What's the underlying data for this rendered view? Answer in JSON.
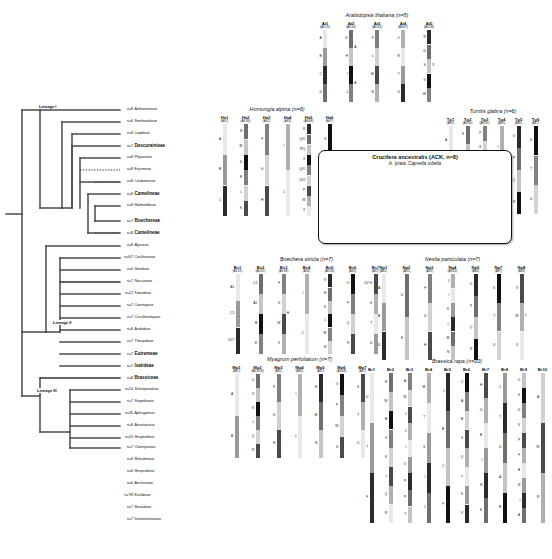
{
  "tree": {
    "lineages": [
      {
        "label": "Lineage I",
        "x": 38,
        "y": 34
      },
      {
        "label": "Lineage II",
        "x": 56,
        "y": 219
      },
      {
        "label": "Lineage III",
        "x": 38,
        "y": 268
      }
    ],
    "taxa": [
      {
        "n": "n=8",
        "name": "Aethionemeae",
        "bold": false
      },
      {
        "n": "n=6",
        "name": "Smelowskieae",
        "bold": false
      },
      {
        "n": "n=8",
        "name": "Lepidieae",
        "bold": false
      },
      {
        "n": "n=7",
        "name": "Descurainieae",
        "bold": true
      },
      {
        "n": "n=8",
        "name": "Physarieae",
        "bold": false
      },
      {
        "n": "n=8",
        "name": "Erysimeae",
        "bold": false
      },
      {
        "n": "n=8",
        "name": "Cardamineae",
        "bold": false
      },
      {
        "n": "n=8",
        "name": "Camelineae",
        "bold": true
      },
      {
        "n": "n=8",
        "name": "Halimolobeae",
        "bold": false
      },
      {
        "n": "n=7",
        "name": "Boechereae",
        "bold": true
      },
      {
        "n": "n=8",
        "name": "Camelineae",
        "bold": true
      },
      {
        "n": "n=8",
        "name": "Alysseae",
        "bold": false
      },
      {
        "n": "n=6/7",
        "name": "Cochlearieae",
        "bold": false
      },
      {
        "n": "n=6",
        "name": "Iberideae",
        "bold": false
      },
      {
        "n": "n=7",
        "name": "Noccaeeae",
        "bold": false
      },
      {
        "n": "n=12",
        "name": "Fanoideae",
        "bold": false
      },
      {
        "n": "n=7",
        "name": "Conringieae",
        "bold": false
      },
      {
        "n": "n=7",
        "name": "Crucihimalayeae",
        "bold": false
      },
      {
        "n": "n=8",
        "name": "Arabideae",
        "bold": false
      },
      {
        "n": "n=7",
        "name": "Thlaspideae",
        "bold": false
      },
      {
        "n": "n=7",
        "name": "Eutremeae",
        "bold": true
      },
      {
        "n": "n=7",
        "name": "Isatideae",
        "bold": true
      },
      {
        "n": "n=8",
        "name": "Brassiceae",
        "bold": true
      },
      {
        "n": "n=14",
        "name": "Schizopetaleae",
        "bold": false
      },
      {
        "n": "n=7",
        "name": "Sisymbrieae",
        "bold": false
      },
      {
        "n": "n=36",
        "name": "Aphragmeae",
        "bold": false
      },
      {
        "n": "n=8",
        "name": "Anastaticeae",
        "bold": false
      },
      {
        "n": "n=10",
        "name": "Hesperideae",
        "bold": false
      },
      {
        "n": "n=7",
        "name": "Chorisporeae",
        "bold": false
      },
      {
        "n": "n=8",
        "name": "Malcolmieae",
        "bold": false
      },
      {
        "n": "n=6",
        "name": "Hesperideae",
        "bold": false
      },
      {
        "n": "n=6",
        "name": "Anchonieae",
        "bold": false
      },
      {
        "n": "n=7/8",
        "name": "Euclidieae",
        "bold": false
      },
      {
        "n": "n=7",
        "name": "Buniadeae",
        "bold": false
      },
      {
        "n": "n=7",
        "name": "Dontostemoneae",
        "bold": false
      }
    ]
  },
  "ack_box": {
    "title": "Crucifera ancestralis (ACK, n=8)",
    "subtitle": "A. lyrata, Capsella rubella"
  },
  "chart_data": {
    "type": "diagram",
    "panels": [
      {
        "id": "arabidopsis",
        "title": "Arabidopsis thaliana (n=5)",
        "chromosomes": [
          {
            "name": "At1",
            "sub": "(AK1/5)",
            "left": [
              "A",
              "B",
              "C",
              "D"
            ],
            "right": []
          },
          {
            "name": "At2",
            "sub": "(AK3/4)",
            "left": [
              "K",
              "H",
              "I",
              "J"
            ],
            "right": [
              "A",
              "B"
            ]
          },
          {
            "name": "At3",
            "sub": "(AK2/3)",
            "left": [
              "F",
              "L",
              "M",
              "N"
            ],
            "right": []
          },
          {
            "name": "At4",
            "sub": "(AK6/7)",
            "left": [
              "O",
              "R",
              "T",
              "U"
            ],
            "right": []
          },
          {
            "name": "At5",
            "sub": "(AK5/8)",
            "left": [
              "R",
              "G",
              "S",
              "V",
              "W"
            ],
            "right": [
              "X"
            ]
          }
        ]
      },
      {
        "id": "hornungia",
        "title": "Hornungia alpina (n=6)",
        "chromosomes": [
          {
            "name": "Ha1",
            "sub": "(AK1)",
            "left": [
              "A",
              "B",
              "C"
            ],
            "right": []
          },
          {
            "name": "Ha2",
            "sub": "(AK3/4)",
            "left": [
              "N",
              "M",
              "D",
              "E",
              "L",
              "K"
            ],
            "right": []
          },
          {
            "name": "Ha3",
            "sub": "(AK2)",
            "left": [
              "F",
              "G",
              "H"
            ],
            "right": []
          },
          {
            "name": "Ha4",
            "sub": "(AK3)",
            "left": [
              "I",
              "J"
            ],
            "right": []
          },
          {
            "name": "Ha5",
            "sub": "(AK6/8)",
            "left": [
              "R",
              "Q/O",
              "P/Q",
              "V",
              "Q/O",
              "Q/O",
              "P",
              "W",
              "X"
            ],
            "right": []
          },
          {
            "name": "Ha6",
            "sub": "(AK7)",
            "left": [
              "S",
              "T",
              "U"
            ],
            "right": []
          }
        ]
      },
      {
        "id": "turritis",
        "title": "Turritis glabra (n=6)",
        "chromosomes": [
          {
            "name": "Tg1",
            "sub": "(AK1)",
            "left": [
              "A",
              "B",
              "C"
            ],
            "right": []
          },
          {
            "name": "Tg2",
            "sub": "(AK3/4)",
            "left": [
              "K",
              "W",
              "V",
              "D",
              "E"
            ],
            "right": []
          },
          {
            "name": "Tg3",
            "sub": "(AK2/5)",
            "left": [
              "F",
              "G",
              "H",
              "K",
              "L",
              "M"
            ],
            "right": []
          },
          {
            "name": "Tg4",
            "sub": "(AK5)",
            "left": [
              "I",
              "J"
            ],
            "right": []
          },
          {
            "name": "Tg5",
            "sub": "(AK6)",
            "left": [
              "O",
              "P",
              "Q",
              "R"
            ],
            "right": []
          },
          {
            "name": "Tg6",
            "sub": "(AK7)",
            "left": [
              "S",
              "T",
              "U"
            ],
            "right": []
          }
        ]
      },
      {
        "id": "ack",
        "title": "Crucifera ancestralis (ACK, n=8)",
        "chromosomes": [
          {
            "name": "AK1",
            "sub": "",
            "left": [
              "A",
              "B",
              "C"
            ],
            "right": []
          },
          {
            "name": "AK2",
            "sub": "",
            "left": [
              "D",
              "E"
            ],
            "right": []
          },
          {
            "name": "AK3",
            "sub": "",
            "left": [
              "F",
              "G",
              "H"
            ],
            "right": []
          },
          {
            "name": "AK4",
            "sub": "",
            "left": [
              "I",
              "J"
            ],
            "right": []
          },
          {
            "name": "AK5",
            "sub": "",
            "left": [
              "K",
              "L",
              "M",
              "N"
            ],
            "right": []
          },
          {
            "name": "AK6",
            "sub": "",
            "left": [
              "O",
              "P",
              "Q",
              "R"
            ],
            "right": []
          },
          {
            "name": "AK7",
            "sub": "",
            "left": [
              "S",
              "T",
              "U"
            ],
            "right": []
          },
          {
            "name": "AK8",
            "sub": "",
            "left": [
              "V",
              "W",
              "X"
            ],
            "right": []
          }
        ]
      },
      {
        "id": "boechera",
        "title": "Boechera stricta (n=7)",
        "chromosomes": [
          {
            "name": "Bs1",
            "sub": "(AK1/5)",
            "left": [
              "A1",
              "C1",
              "D1?"
            ],
            "right": []
          },
          {
            "name": "Bs2",
            "sub": "(AK1/5)",
            "left": [
              "C2",
              "A2",
              "B",
              "E"
            ],
            "right": []
          },
          {
            "name": "Bs3",
            "sub": "(AK3/8)",
            "left": [
              "F",
              "G",
              "W",
              "X"
            ],
            "right": [
              "H"
            ]
          },
          {
            "name": "Bs4",
            "sub": "(AK4)",
            "left": [
              "I",
              "J"
            ],
            "right": []
          },
          {
            "name": "Bs5",
            "sub": "(AK5/8)",
            "left": [
              "V",
              "H",
              "K",
              "L",
              "M",
              "N"
            ],
            "right": []
          },
          {
            "name": "Bs6",
            "sub": "(AK6)",
            "left": [
              "O",
              "P",
              "Q",
              "R"
            ],
            "right": []
          },
          {
            "name": "Bs7",
            "sub": "(AK7)",
            "left": [
              "D2?e",
              "S",
              "T",
              "U"
            ],
            "right": []
          }
        ]
      },
      {
        "id": "neslia",
        "title": "Neslia paniculata (n=7)",
        "chromosomes": [
          {
            "name": "Np1",
            "sub": "(AK1)",
            "left": [
              "A",
              "B",
              "D"
            ],
            "right": []
          },
          {
            "name": "Np2",
            "sub": "(AK5)",
            "left": [
              "D",
              "E"
            ],
            "right": []
          },
          {
            "name": "Np3",
            "sub": "(AK3)",
            "left": [
              "F",
              "G",
              "H"
            ],
            "right": []
          },
          {
            "name": "Np4",
            "sub": "(AK4/5)",
            "left": [
              "J",
              "I",
              "K",
              "L",
              "M",
              "N"
            ],
            "right": []
          },
          {
            "name": "Np5",
            "sub": "(AK6)",
            "left": [
              "O",
              "P",
              "Q",
              "R"
            ],
            "right": []
          },
          {
            "name": "Np7",
            "sub": "(AK7)",
            "left": [
              "S",
              "T",
              "U"
            ],
            "right": []
          },
          {
            "name": "Np8",
            "sub": "(AK8)",
            "left": [
              "V",
              "W",
              "X"
            ],
            "right": [
              "T"
            ]
          }
        ]
      },
      {
        "id": "myagrum",
        "title": "Myagrum perfoliatum (n=7)",
        "chromosomes": [
          {
            "name": "Mp1",
            "sub": "(AK1)",
            "left": [
              "A",
              "B"
            ],
            "right": []
          },
          {
            "name": "Mp2",
            "sub": "(AK3/5/8)",
            "left": [
              "O",
              "V",
              "K",
              "L",
              "Q",
              "R"
            ],
            "right": []
          },
          {
            "name": "Mp3",
            "sub": "(AK5)",
            "left": [
              "F",
              "G",
              "H"
            ],
            "right": []
          },
          {
            "name": "Mp4",
            "sub": "(AK4)",
            "left": [
              "I",
              "J"
            ],
            "right": []
          },
          {
            "name": "Mp5",
            "sub": "(AK5)",
            "left": [
              "R",
              "M",
              "N"
            ],
            "right": []
          },
          {
            "name": "Mp6",
            "sub": "(AK6/8)",
            "left": [
              "O",
              "P",
              "W",
              "S"
            ],
            "right": []
          },
          {
            "name": "Mp7",
            "sub": "(AK7)",
            "left": [
              "S",
              "T",
              "U"
            ],
            "right": []
          }
        ]
      },
      {
        "id": "brassica",
        "title": "Brassica rapa (n=10)",
        "chromosomes": [
          {
            "name": "Br1",
            "sub": "",
            "left": [
              "U",
              "T",
              "F"
            ],
            "right": []
          },
          {
            "name": "Br2",
            "sub": "",
            "left": [
              "R",
              "W",
              "B",
              "V",
              "K",
              "L",
              "Q",
              "R"
            ],
            "right": []
          },
          {
            "name": "Br3",
            "sub": "",
            "left": [
              "A",
              "W",
              "J",
              "J",
              "I",
              "O",
              "P",
              "P",
              "T"
            ],
            "right": []
          },
          {
            "name": "Br4",
            "sub": "",
            "left": [
              "M",
              "T",
              "S",
              "I",
              "J"
            ],
            "right": []
          },
          {
            "name": "Br5",
            "sub": "",
            "left": [
              "J",
              "B",
              "C",
              "F"
            ],
            "right": []
          },
          {
            "name": "Br6",
            "sub": "",
            "left": [
              "C",
              "A",
              "B",
              "X",
              "Q",
              "L",
              "K",
              "V"
            ],
            "right": []
          },
          {
            "name": "Br7",
            "sub": "",
            "left": [
              "H",
              "G",
              "B",
              "I",
              "N",
              "E"
            ],
            "right": []
          },
          {
            "name": "Br8",
            "sub": "",
            "left": [
              "C",
              "T",
              "U",
              "A",
              "B"
            ],
            "right": []
          },
          {
            "name": "Br9",
            "sub": "",
            "left": [
              "O",
              "G",
              "D",
              "V",
              "P",
              "F",
              "B",
              "N",
              "I",
              "A"
            ],
            "right": []
          },
          {
            "name": "Br10",
            "sub": "",
            "left": [
              "A",
              "W",
              "R"
            ],
            "right": []
          }
        ]
      }
    ]
  }
}
